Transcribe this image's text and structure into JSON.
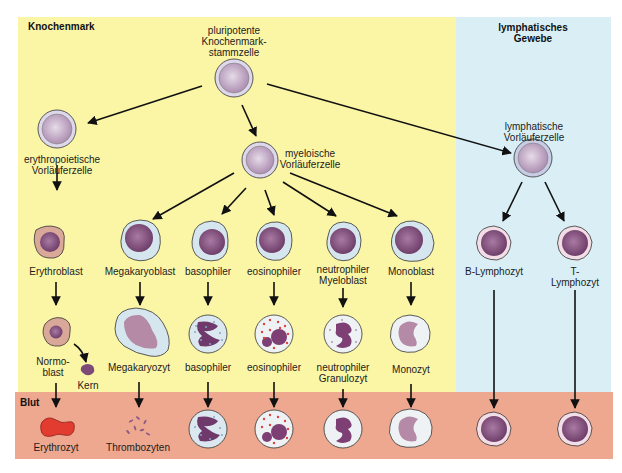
{
  "regions": {
    "bone_marrow": {
      "label": "Knochenmark",
      "color": "#fbf5a6"
    },
    "lymphatic": {
      "label": "lymphatisches\nGewebe",
      "color": "#d9eff5"
    },
    "blood": {
      "label": "Blut",
      "color": "#eda88f"
    }
  },
  "colors": {
    "stem_membrane": "#c9c4d9",
    "stem_nucleus": "#b99cbb",
    "nucleus": "#7d4a78",
    "cytoplasm_blue": "#d6e6ee",
    "cytoplasm_pink": "#d8a89a",
    "erythrocyte": "#e23b2f",
    "granule_red": "#e0403f",
    "granule_blue": "#7fa9c9",
    "arrow": "#111111"
  },
  "cells": {
    "stem_cell": {
      "label": "pluripotente\nKnochenmark-\nstammzelle"
    },
    "erythro_progenitor": {
      "label": "erythropoietische\nVorläuferzelle"
    },
    "myeloid_progenitor": {
      "label": "myeloische\nVorläuferzelle"
    },
    "lymphoid_progenitor": {
      "label": "lymphatische\nVorläuferzelle"
    },
    "row1": [
      {
        "id": "erythroblast",
        "label": "Erythroblast"
      },
      {
        "id": "megakaryoblast",
        "label": "Megakaryoblast"
      },
      {
        "id": "basophil_blast",
        "label": "basophiler"
      },
      {
        "id": "eosinophil_blast",
        "label": "eosinophiler"
      },
      {
        "id": "neutrophil_myeloblast",
        "label": "neutrophiler\nMyeloblast"
      },
      {
        "id": "monoblast",
        "label": "Monoblast"
      },
      {
        "id": "b_lymphocyte",
        "label": "B-Lymphozyt"
      },
      {
        "id": "t_lymphocyte",
        "label": "T-Lymphozyt"
      }
    ],
    "row2": [
      {
        "id": "normoblast",
        "label": "Normo-\nblast"
      },
      {
        "id": "kern",
        "label": "Kern"
      },
      {
        "id": "megakaryocyte",
        "label": "Megakaryozyt"
      },
      {
        "id": "basophil",
        "label": "basophiler"
      },
      {
        "id": "eosinophil",
        "label": "eosinophiler"
      },
      {
        "id": "neutrophil",
        "label": "neutrophiler\nGranulozyt"
      },
      {
        "id": "monocyte",
        "label": "Monozyt"
      }
    ],
    "blood_row": [
      {
        "id": "erythrocyte",
        "label": "Erythrozyt"
      },
      {
        "id": "thrombocytes",
        "label": "Thrombozyten"
      }
    ]
  }
}
